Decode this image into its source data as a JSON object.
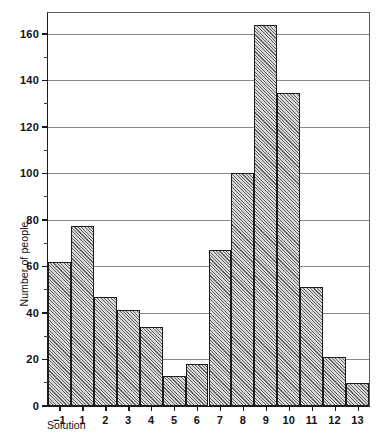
{
  "chart_data": {
    "type": "bar",
    "title": "",
    "xlabel": "Solution",
    "ylabel": "Number of people",
    "categories": [
      "−1",
      "1",
      "2",
      "3",
      "4",
      "5",
      "6",
      "7",
      "8",
      "9",
      "10",
      "11",
      "12",
      "13"
    ],
    "values": [
      62,
      77.5,
      47,
      41.5,
      34,
      13,
      18,
      67,
      100,
      164,
      134.5,
      51,
      21,
      10
    ],
    "ylim": [
      0,
      169
    ],
    "ytick_major": [
      0,
      20,
      40,
      60,
      80,
      100,
      120,
      140,
      160
    ],
    "ytick_minor": [
      10,
      30,
      50,
      70,
      90,
      110,
      130,
      150
    ],
    "ytick_labels": [
      "0",
      "20",
      "40",
      "60",
      "80",
      "100",
      "120",
      "140",
      "160"
    ],
    "gridlines": [
      20,
      40,
      60,
      80,
      100,
      120,
      140,
      160
    ],
    "grid": true,
    "legend": null,
    "bar_style": "diagonal-hatch",
    "bar_fill_color": "#d8d8d8",
    "bar_edge_color": "#1c1c1c",
    "axis_color": "#1a1a1a",
    "grid_color": "#8a8a8a"
  }
}
